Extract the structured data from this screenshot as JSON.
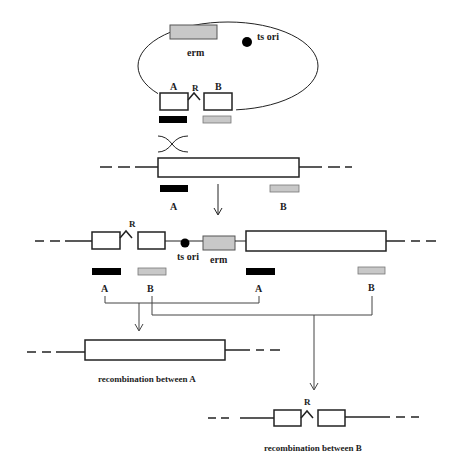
{
  "plasmid": {
    "erm_label": "erm",
    "ts_ori_label": "ts ori",
    "fragment_a_label": "A",
    "recombinase_label": "R",
    "fragment_b_label": "B"
  },
  "chromosome": {
    "fragment_a_label": "A",
    "fragment_b_label": "B"
  },
  "integrated": {
    "recombinase_label": "R",
    "ts_ori_label": "ts ori",
    "erm_label": "erm",
    "a1_label": "A",
    "b1_label": "B",
    "a2_label": "A",
    "b2_label": "B"
  },
  "outcome_a": {
    "caption": "recombination between A"
  },
  "outcome_b": {
    "recombinase_label": "R",
    "caption": "recombination between B"
  },
  "colors": {
    "line": "#222222",
    "erm_fill": "#c8c8c8",
    "a_fill": "#000000",
    "b_fill": "#c8c8c8"
  }
}
